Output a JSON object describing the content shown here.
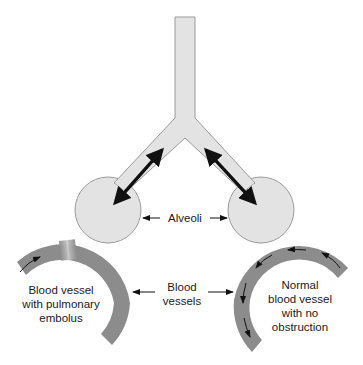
{
  "diagram": {
    "type": "anatomical-schematic",
    "colors": {
      "airway_fill": "#e3e3e3",
      "airway_stroke": "#9a9a9a",
      "vessel_fill": "#8c8c8c",
      "embolus_highlight": "#c4c4c4",
      "arrow": "#111111",
      "background": "#ffffff"
    },
    "labels": {
      "alveoli": "Alveoli",
      "blood_vessels_line1": "Blood",
      "blood_vessels_line2": "vessels",
      "left_vessel_line1": "Blood vessel",
      "left_vessel_line2": "with pulmonary",
      "left_vessel_line3": "embolus",
      "right_vessel_line1": "Normal",
      "right_vessel_line2": "blood vessel",
      "right_vessel_line3": "with no",
      "right_vessel_line4": "obstruction"
    },
    "elements": [
      {
        "name": "trachea",
        "description": "vertical airway splitting into two bronchi"
      },
      {
        "name": "left-alveolus",
        "description": "circle with bidirectional gas exchange arrow"
      },
      {
        "name": "right-alveolus",
        "description": "circle with bidirectional gas exchange arrow"
      },
      {
        "name": "left-blood-vessel",
        "description": "arc vessel with embolus (light band), single flow arrow"
      },
      {
        "name": "right-blood-vessel",
        "description": "arc vessel with continuous flow arrows"
      }
    ]
  }
}
